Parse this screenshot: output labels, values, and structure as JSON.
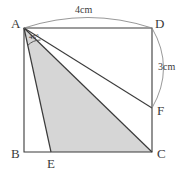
{
  "figure": {
    "background_color": "#ffffff",
    "stroke_color": "#3b3b3b",
    "arc_color": "#8c8c8c",
    "shade_color": "#d6d6d6",
    "vertices": {
      "A": {
        "label": "A",
        "x": 24,
        "y": 28
      },
      "B": {
        "label": "B",
        "x": 24,
        "y": 152
      },
      "C": {
        "label": "C",
        "x": 152,
        "y": 152
      },
      "D": {
        "label": "D",
        "x": 152,
        "y": 28
      },
      "E": {
        "label": "E",
        "x": 51,
        "y": 152
      },
      "F": {
        "label": "F",
        "x": 152,
        "y": 108
      }
    },
    "dimensions": [
      {
        "name": "top-arc-dimension",
        "label": "4cm",
        "from": "A",
        "to": "D"
      },
      {
        "name": "right-arc-dimension",
        "label": "3cm",
        "from": "D",
        "to": "F"
      }
    ],
    "angles": [
      {
        "name": "angle-at-A",
        "label": "45°",
        "value": 45,
        "unit": "degrees",
        "vertex": "A"
      }
    ],
    "shaded_region": {
      "name": "triangle-AEC",
      "points": [
        "A",
        "E",
        "C"
      ],
      "fill": "#d6d6d6"
    },
    "segments": [
      {
        "name": "side-AD",
        "from": "A",
        "to": "D"
      },
      {
        "name": "side-DC",
        "from": "D",
        "to": "C"
      },
      {
        "name": "side-CB",
        "from": "C",
        "to": "B"
      },
      {
        "name": "side-BA",
        "from": "B",
        "to": "A"
      },
      {
        "name": "segment-AE",
        "from": "A",
        "to": "E"
      },
      {
        "name": "segment-AC",
        "from": "A",
        "to": "C"
      },
      {
        "name": "segment-AF",
        "from": "A",
        "to": "F"
      }
    ]
  }
}
